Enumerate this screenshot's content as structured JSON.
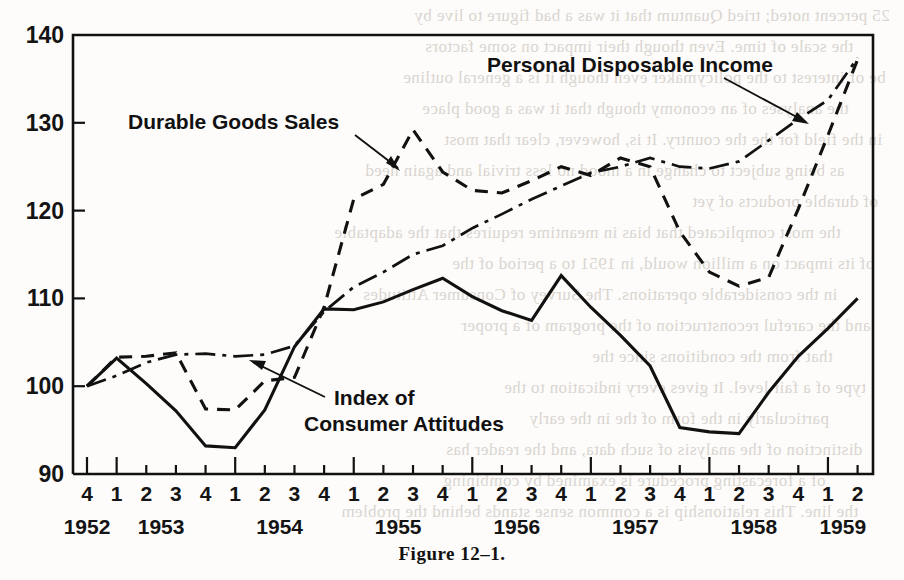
{
  "figure": {
    "caption": "Figure 12–1."
  },
  "chart_data": {
    "type": "line",
    "title": "",
    "xlabel": "",
    "ylabel": "",
    "ylim": [
      90,
      140
    ],
    "yticks": [
      90,
      100,
      110,
      120,
      130,
      140
    ],
    "grid": false,
    "legend_position": "inline-annotations",
    "x": [
      "1952 Q4",
      "1953 Q1",
      "1953 Q2",
      "1953 Q3",
      "1953 Q4",
      "1954 Q1",
      "1954 Q2",
      "1954 Q3",
      "1954 Q4",
      "1955 Q1",
      "1955 Q2",
      "1955 Q3",
      "1955 Q4",
      "1956 Q1",
      "1956 Q2",
      "1956 Q3",
      "1956 Q4",
      "1957 Q1",
      "1957 Q2",
      "1957 Q3",
      "1957 Q4",
      "1958 Q1",
      "1958 Q2",
      "1958 Q3",
      "1958 Q4",
      "1959 Q1",
      "1959 Q2"
    ],
    "quarter_labels": [
      "4",
      "1",
      "2",
      "3",
      "4",
      "1",
      "2",
      "3",
      "4",
      "1",
      "2",
      "3",
      "4",
      "1",
      "2",
      "3",
      "4",
      "1",
      "2",
      "3",
      "4",
      "1",
      "2",
      "3",
      "4",
      "1",
      "2"
    ],
    "year_labels": [
      "1952",
      "1953",
      "1954",
      "1955",
      "1956",
      "1957",
      "1958",
      "1959"
    ],
    "series": [
      {
        "name": "Index of Consumer Attitudes",
        "style": "solid",
        "values": [
          100,
          103.2,
          100.3,
          97.2,
          93.2,
          93.0,
          97.3,
          104.5,
          108.8,
          108.7,
          109.6,
          111.0,
          112.3,
          110.2,
          108.6,
          107.5,
          112.6,
          109.0,
          105.8,
          102.3,
          95.3,
          94.8,
          94.6,
          99.3,
          103.4,
          106.6,
          110.0
        ]
      },
      {
        "name": "Durable Goods Sales",
        "style": "dashed",
        "values": [
          100,
          103.3,
          103.4,
          103.8,
          97.4,
          97.3,
          100.6,
          101.0,
          109.0,
          121.3,
          123.0,
          129.2,
          124.4,
          122.3,
          122.0,
          123.4,
          125.0,
          124.0,
          126.0,
          125.0,
          117.6,
          113.0,
          111.4,
          112.4,
          120.2,
          128.6,
          137.2
        ]
      },
      {
        "name": "Personal Disposable Income",
        "style": "dash-dot",
        "values": [
          100,
          101.2,
          102.7,
          103.6,
          103.7,
          103.4,
          103.6,
          104.6,
          108.5,
          111.3,
          113.0,
          115.0,
          116.0,
          118.0,
          119.6,
          121.3,
          122.8,
          124.3,
          125.0,
          126.0,
          125.0,
          124.8,
          125.6,
          128.0,
          130.4,
          132.6,
          137.4
        ]
      }
    ],
    "annotations": [
      {
        "text": "Durable Goods Sales",
        "target_point": "1955 Q1"
      },
      {
        "text": "Personal Disposable Income",
        "target_point": "1959 Q1"
      },
      {
        "text_line1": "Index of",
        "text_line2": "Consumer   Attitudes",
        "target_point": "1954 Q3"
      }
    ]
  },
  "bleed_text": {
    "lines": [
      "25 percent noted; tried Quantum that it was a bad figure to live by",
      "the scale of time. Even though their impact on some factors",
      "be of interest to the policymaker even though it is a general outline",
      "the analyses of an economy though that it was a good place",
      "in the field for the the country. It is, however, clear that most",
      "as being subject to change in a mood no less trivial and again need",
      "of durable products of yet",
      "the most complicated that bias in meantime requires that the adaptable",
      "of its impact on a million would, in 1951 to a period of the",
      "in the considerable operations. The Survey of Consumer Attitudes",
      "and the careful reconstruction of the program of a proper",
      "that from the conditions since the",
      "type of a fair level. It gives every indication to the",
      "particularly in the form of the in the early",
      "distinction of the analysis of such data, and the reader has",
      "of a forecasting procedure is examined by combining",
      "the line. This relationship is a common sense stands behind the  problem"
    ]
  }
}
